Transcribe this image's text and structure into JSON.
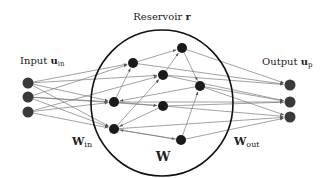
{
  "diagram": {
    "title": "Reservoir r",
    "labels": {
      "reservoir": {
        "text": "Reservoir",
        "symbol": "r"
      },
      "input": {
        "text": "Input",
        "symbol": "u",
        "sub": "in"
      },
      "output": {
        "text": "Output",
        "symbol": "u",
        "sub": "p"
      },
      "w_in": {
        "symbol": "W",
        "sub": "in"
      },
      "w": {
        "symbol": "W"
      },
      "w_out": {
        "symbol": "W",
        "sub": "out"
      }
    },
    "colors": {
      "node": "#1a1a1a",
      "io_node": "#3a3a3a",
      "edge": "#7a7a7a",
      "circle": "#111111"
    },
    "reservoir_circle": {
      "cx": 162,
      "cy": 103,
      "rx": 71,
      "ry": 73
    },
    "input_nodes": [
      {
        "id": "i1",
        "x": 28,
        "y": 83
      },
      {
        "id": "i2",
        "x": 28,
        "y": 97
      },
      {
        "id": "i3",
        "x": 28,
        "y": 112
      }
    ],
    "output_nodes": [
      {
        "id": "o1",
        "x": 290,
        "y": 85
      },
      {
        "id": "o2",
        "x": 290,
        "y": 102
      },
      {
        "id": "o3",
        "x": 290,
        "y": 117
      }
    ],
    "reservoir_nodes": [
      {
        "id": "A",
        "x": 133,
        "y": 63
      },
      {
        "id": "B",
        "x": 182,
        "y": 48
      },
      {
        "id": "C",
        "x": 163,
        "y": 75
      },
      {
        "id": "D",
        "x": 200,
        "y": 86
      },
      {
        "id": "E",
        "x": 114,
        "y": 102
      },
      {
        "id": "F",
        "x": 163,
        "y": 106
      },
      {
        "id": "G",
        "x": 114,
        "y": 129
      },
      {
        "id": "H",
        "x": 181,
        "y": 140
      }
    ],
    "internal_edges": [
      [
        "E",
        "A"
      ],
      [
        "A",
        "B"
      ],
      [
        "G",
        "C"
      ],
      [
        "C",
        "B"
      ],
      [
        "B",
        "D"
      ],
      [
        "H",
        "D"
      ],
      [
        "D",
        "E"
      ],
      [
        "F",
        "G"
      ],
      [
        "G",
        "H"
      ],
      [
        "H",
        "G"
      ],
      [
        "E",
        "F"
      ]
    ],
    "input_edges": [
      [
        "i1",
        "A"
      ],
      [
        "i1",
        "C"
      ],
      [
        "i1",
        "E"
      ],
      [
        "i1",
        "G"
      ],
      [
        "i2",
        "A"
      ],
      [
        "i2",
        "E"
      ],
      [
        "i2",
        "F"
      ],
      [
        "i2",
        "G"
      ],
      [
        "i3",
        "E"
      ],
      [
        "i3",
        "G"
      ],
      [
        "i3",
        "C"
      ]
    ],
    "output_edges": [
      [
        "B",
        "o1"
      ],
      [
        "A",
        "o1"
      ],
      [
        "C",
        "o1"
      ],
      [
        "D",
        "o2"
      ],
      [
        "C",
        "o2"
      ],
      [
        "E",
        "o2"
      ],
      [
        "F",
        "o2"
      ],
      [
        "D",
        "o3"
      ],
      [
        "F",
        "o3"
      ],
      [
        "G",
        "o3"
      ],
      [
        "H",
        "o3"
      ]
    ]
  }
}
